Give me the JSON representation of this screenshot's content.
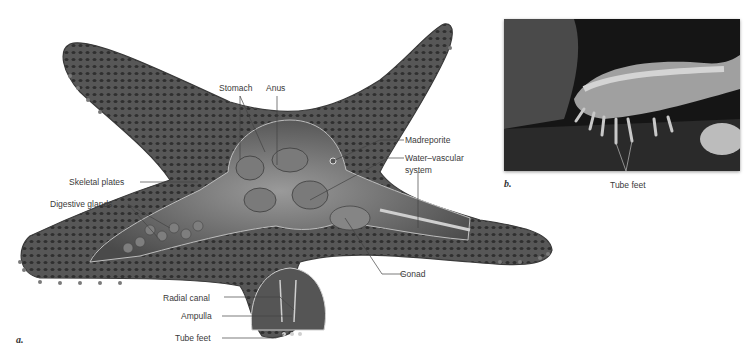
{
  "figure": {
    "panel_a": {
      "letter": "a.",
      "labels": {
        "stomach": "Stomach",
        "anus": "Anus",
        "madreporite": "Madreporite",
        "water_vascular": "Water–vascular",
        "water_vascular_2": "system",
        "skeletal_plates": "Skeletal plates",
        "digestive_glands": "Digestive glands",
        "gonad": "Gonad",
        "radial_canal": "Radial canal",
        "ampulla": "Ampulla",
        "tube_feet": "Tube feet"
      }
    },
    "panel_b": {
      "letter": "b.",
      "labels": {
        "tube_feet": "Tube feet"
      }
    },
    "colors": {
      "body": "#5a5a5a",
      "body_dark": "#3c3c3c",
      "plates": "#2e2e2e",
      "interior": "#8a8a8a",
      "leader": "#444444",
      "photo_bg": "#1a1a1a"
    }
  }
}
